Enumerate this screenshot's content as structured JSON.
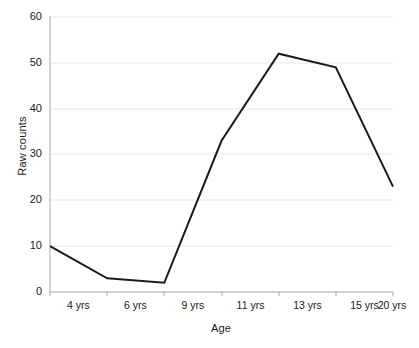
{
  "chart_data": {
    "type": "line",
    "title": "",
    "xlabel": "Age",
    "ylabel": "Raw counts",
    "categories": [
      "4 yrs",
      "6 yrs",
      "9 yrs",
      "11 yrs",
      "13 yrs",
      "15 yrs",
      "20 yrs"
    ],
    "values": [
      10,
      3,
      2,
      33,
      52,
      49,
      23
    ],
    "series": [
      {
        "name": "Raw counts",
        "values": [
          10,
          3,
          2,
          33,
          52,
          49,
          23
        ]
      }
    ],
    "ylim": [
      0,
      60
    ],
    "yticks": [
      0,
      10,
      20,
      30,
      40,
      50,
      60
    ],
    "ytick_labels": [
      "0",
      "10",
      "20",
      "30",
      "40",
      "50",
      "60"
    ],
    "grid": "horizontal",
    "legend": "none",
    "line_color": "#1a1a1a",
    "grid_color": "#e6e6e6",
    "axis_color": "#9a9a9a",
    "background_color": "#ffffff"
  }
}
